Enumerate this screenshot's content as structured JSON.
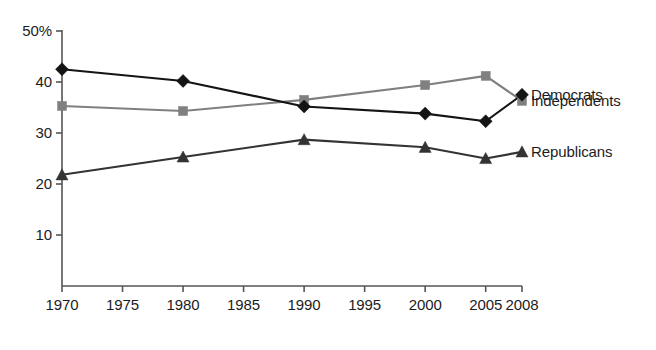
{
  "chart_data": {
    "type": "line",
    "title": "",
    "subtitle": "",
    "xlabel": "",
    "ylabel": "",
    "x": [
      1970,
      1980,
      1990,
      2000,
      2005,
      2008
    ],
    "xtick_labels": [
      "1970",
      "1975",
      "1980",
      "1985",
      "1990",
      "1995",
      "2000",
      "2005",
      "2008"
    ],
    "xtick_values": [
      1970,
      1975,
      1980,
      1985,
      1990,
      1995,
      2000,
      2005,
      2008
    ],
    "ytick_labels": [
      "50%",
      "40",
      "30",
      "20",
      "10"
    ],
    "ytick_values": [
      50,
      40,
      30,
      20,
      10
    ],
    "xlim": [
      1970,
      2008
    ],
    "ylim": [
      0,
      50
    ],
    "grid": false,
    "legend_position": "right-inline",
    "series": [
      {
        "name": "Independents",
        "marker": "square",
        "color": "#808080",
        "label_value_year": 2008,
        "values": [
          35.3,
          34.3,
          36.5,
          39.4,
          41.2,
          36.3
        ]
      },
      {
        "name": "Democrats",
        "marker": "diamond",
        "color": "#141414",
        "label_value_year": 2008,
        "values": [
          42.5,
          40.2,
          35.2,
          33.8,
          32.3,
          37.5
        ]
      },
      {
        "name": "Republicans",
        "marker": "triangle",
        "color": "#333333",
        "label_value_year": 2008,
        "values": [
          21.8,
          25.3,
          28.7,
          27.2,
          25.0,
          26.3
        ]
      }
    ]
  },
  "axes": {
    "axis_color": "#555555",
    "tick_color": "#555555"
  }
}
